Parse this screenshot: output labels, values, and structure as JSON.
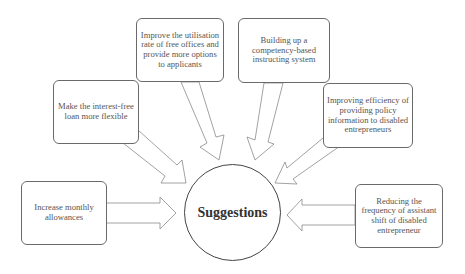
{
  "diagram": {
    "center": {
      "label": "Suggestions"
    },
    "nodes": [
      {
        "id": "increase-allowances",
        "label": "Increase monthly allowances"
      },
      {
        "id": "flexible-loan",
        "label": "Make the interest-free loan more flexible"
      },
      {
        "id": "free-offices",
        "label": "Improve the utilisation rate of free offices and provide more options to applicants"
      },
      {
        "id": "instructing-system",
        "label": "Building up a competency-based instructing system"
      },
      {
        "id": "policy-information",
        "label": "Improving efficiency of providing policy information to disabled entrepreneurs"
      },
      {
        "id": "assistant-shift",
        "label": "Reducing the frequency of assistant shift of disabled entrepreneur"
      }
    ],
    "edges": [
      {
        "from": "increase-allowances",
        "to": "center"
      },
      {
        "from": "flexible-loan",
        "to": "center"
      },
      {
        "from": "free-offices",
        "to": "center"
      },
      {
        "from": "instructing-system",
        "to": "center"
      },
      {
        "from": "policy-information",
        "to": "center"
      },
      {
        "from": "assistant-shift",
        "to": "center"
      }
    ],
    "colors": {
      "stroke": "#6a6a6a",
      "text": "#555555",
      "background": "#ffffff"
    }
  }
}
